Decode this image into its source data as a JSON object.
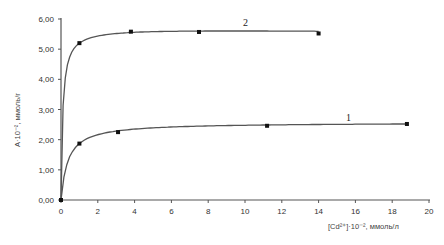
{
  "chart_data": {
    "type": "line",
    "title": "",
    "xlabel": "[Cd²⁺]·10⁻², ммоль/л",
    "ylabel": "A·10⁻², ммоль/г",
    "xlim": [
      0,
      20
    ],
    "ylim": [
      0,
      6
    ],
    "x_ticks": [
      "0",
      "2",
      "4",
      "6",
      "8",
      "10",
      "12",
      "14",
      "16",
      "18",
      "20"
    ],
    "y_ticks": [
      "0,00",
      "1,00",
      "2,00",
      "3,00",
      "4,00",
      "5,00",
      "6,00"
    ],
    "grid": false,
    "legend": "curve labels placed inline",
    "series": [
      {
        "name": "1",
        "x": [
          0,
          1.0,
          3.1,
          11.2,
          18.8
        ],
        "y": [
          0,
          1.87,
          2.25,
          2.46,
          2.52
        ]
      },
      {
        "name": "2",
        "x": [
          0,
          1.0,
          3.8,
          7.5,
          14.0
        ],
        "y": [
          0,
          5.2,
          5.58,
          5.57,
          5.52
        ]
      }
    ]
  }
}
